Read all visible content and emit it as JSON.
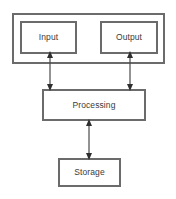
{
  "diagram": {
    "type": "block-diagram",
    "background_color": "#ffffff",
    "box_border_color": "#6b6b6b",
    "connector_color": "#4a4a4a",
    "text_color": "#3a3a3a",
    "nodes": [
      {
        "id": "io-container",
        "label": "",
        "shape": "rectangle"
      },
      {
        "id": "input",
        "label": "Input",
        "shape": "rectangle"
      },
      {
        "id": "output",
        "label": "Output",
        "shape": "rectangle"
      },
      {
        "id": "processing",
        "label": "Processing",
        "shape": "rectangle"
      },
      {
        "id": "storage",
        "label": "Storage",
        "shape": "rectangle"
      }
    ],
    "connectors": [
      {
        "id": "input-processing",
        "from": "input",
        "to": "processing",
        "arrowheads": "both",
        "orientation": "vertical"
      },
      {
        "id": "output-processing",
        "from": "output",
        "to": "processing",
        "arrowheads": "both",
        "orientation": "vertical"
      },
      {
        "id": "processing-storage",
        "from": "processing",
        "to": "storage",
        "arrowheads": "both",
        "orientation": "vertical"
      }
    ]
  }
}
